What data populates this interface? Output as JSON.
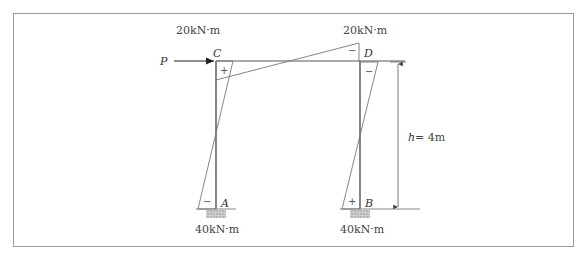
{
  "diagram": {
    "load": {
      "label": "P"
    },
    "joints": {
      "C": "C",
      "D": "D",
      "A": "A",
      "B": "B"
    },
    "moments": {
      "top_left": "20kN·m",
      "top_right": "20kN·m",
      "bottom_left": "40kN·m",
      "bottom_right": "40kN·m"
    },
    "signs": {
      "c_corner": "+",
      "d_beam": "−",
      "d_column": "−",
      "a_base": "−",
      "b_base": "+"
    },
    "dimension": {
      "h_var": "h",
      "h_value": " = 4m"
    }
  }
}
